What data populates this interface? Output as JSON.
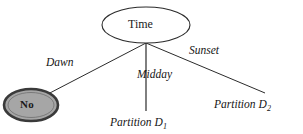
{
  "diagram": {
    "type": "tree-diagram",
    "root_node": {
      "id": "time",
      "label": "Time",
      "shape": "ellipse",
      "fill": "#ffffff",
      "stroke": "#2b2b2b"
    },
    "edges": [
      {
        "id": "dawn",
        "label": "Dawn",
        "from": "time",
        "to": "no"
      },
      {
        "id": "midday",
        "label": "Midday",
        "from": "time",
        "to": "partition-d1"
      },
      {
        "id": "sunset",
        "label": "Sunset",
        "from": "time",
        "to": "partition-d2"
      }
    ],
    "leaves": [
      {
        "id": "no",
        "label": "No",
        "shape": "ellipse",
        "fill": "#a6a6a6",
        "stroke": "#333333",
        "highlighted": true
      },
      {
        "id": "partition-d1",
        "label": "Partition D",
        "subscript": "1",
        "shape": "text"
      },
      {
        "id": "partition-d2",
        "label": "Partition D",
        "subscript": "2",
        "shape": "text"
      }
    ],
    "colors": {
      "background": "#ffffff",
      "line": "#2b2b2b",
      "text": "#151515",
      "highlight_fill": "#a6a6a6",
      "highlight_stroke": "#333333"
    }
  }
}
